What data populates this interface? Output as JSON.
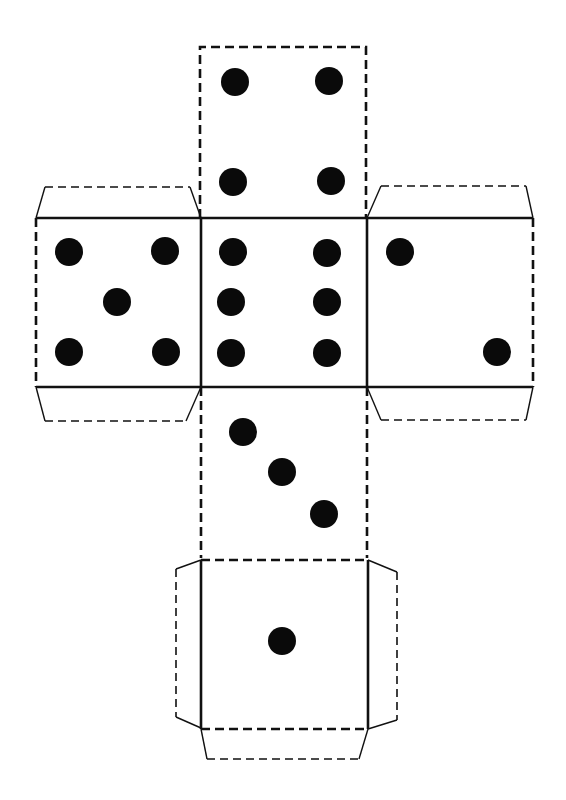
{
  "diagram": {
    "type": "dice-net",
    "colors": {
      "line": "#111111",
      "pip": "#0a0a0a",
      "background": "#ffffff"
    },
    "legend": {
      "dashed_line": "cut line",
      "solid_line": "fold line"
    },
    "faces": [
      {
        "id": "top",
        "value": 4,
        "position": "top"
      },
      {
        "id": "left",
        "value": 5,
        "position": "middle-left"
      },
      {
        "id": "center",
        "value": 6,
        "position": "middle-center"
      },
      {
        "id": "right",
        "value": 2,
        "position": "middle-right"
      },
      {
        "id": "lower",
        "value": 3,
        "position": "lower-center"
      },
      {
        "id": "bottom",
        "value": 1,
        "position": "bottom"
      }
    ],
    "tabs": [
      {
        "id": "left-top-tab",
        "attached_to": "left"
      },
      {
        "id": "left-bottom-tab",
        "attached_to": "left"
      },
      {
        "id": "right-top-tab",
        "attached_to": "right"
      },
      {
        "id": "right-bottom-tab",
        "attached_to": "right"
      },
      {
        "id": "bottom-left-tab",
        "attached_to": "bottom"
      },
      {
        "id": "bottom-right-tab",
        "attached_to": "bottom"
      },
      {
        "id": "bottom-bottom-tab",
        "attached_to": "bottom"
      }
    ]
  }
}
